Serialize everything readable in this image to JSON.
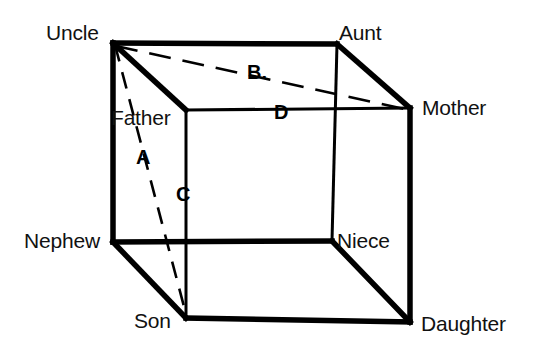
{
  "figure": {
    "type": "necker-cube-kinship-diagram",
    "background_color": "#ffffff",
    "line_color": "#000000"
  },
  "vertices": [
    {
      "id": "uncle",
      "label": "Uncle",
      "x": 113,
      "y": 43,
      "position": "back-top-left"
    },
    {
      "id": "aunt",
      "label": "Aunt",
      "x": 337,
      "y": 44,
      "position": "back-top-right"
    },
    {
      "id": "mother",
      "label": "Mother",
      "x": 410,
      "y": 108,
      "position": "front-top-right"
    },
    {
      "id": "father",
      "label": "Father",
      "x": 186,
      "y": 110,
      "position": "front-top-left"
    },
    {
      "id": "nephew",
      "label": "Nephew",
      "x": 113,
      "y": 242,
      "position": "back-bottom-left"
    },
    {
      "id": "niece",
      "label": "Niece",
      "x": 332,
      "y": 241,
      "position": "back-bottom-right"
    },
    {
      "id": "son",
      "label": "Son",
      "x": 186,
      "y": 318,
      "position": "front-bottom-left"
    },
    {
      "id": "daughter",
      "label": "Daughter",
      "x": 410,
      "y": 322,
      "position": "front-bottom-right"
    }
  ],
  "edge_labels": [
    {
      "id": "a",
      "label": "A",
      "from": "uncle",
      "to": "son",
      "style": "dashed"
    },
    {
      "id": "b",
      "label": "B.",
      "from": "uncle",
      "to": "mother",
      "style": "dashed"
    },
    {
      "id": "c",
      "label": "C",
      "from": "father",
      "to": "son",
      "style": "solid"
    },
    {
      "id": "d",
      "label": "D",
      "from": "father",
      "to": "mother",
      "style": "solid"
    }
  ],
  "edges": [
    {
      "from": "uncle",
      "to": "aunt",
      "style": "solid",
      "weight": "thick"
    },
    {
      "from": "uncle",
      "to": "nephew",
      "style": "solid",
      "weight": "thick"
    },
    {
      "from": "uncle",
      "to": "father",
      "style": "solid",
      "weight": "thick"
    },
    {
      "from": "aunt",
      "to": "mother",
      "style": "solid",
      "weight": "thick"
    },
    {
      "from": "aunt",
      "to": "niece",
      "style": "solid",
      "weight": "thin"
    },
    {
      "from": "nephew",
      "to": "son",
      "style": "solid",
      "weight": "thick"
    },
    {
      "from": "nephew",
      "to": "niece",
      "style": "solid",
      "weight": "thick"
    },
    {
      "from": "niece",
      "to": "daughter",
      "style": "solid",
      "weight": "thick"
    },
    {
      "from": "father",
      "to": "mother",
      "style": "solid",
      "weight": "thin"
    },
    {
      "from": "father",
      "to": "son",
      "style": "solid",
      "weight": "thin"
    },
    {
      "from": "son",
      "to": "daughter",
      "style": "solid",
      "weight": "thick"
    },
    {
      "from": "mother",
      "to": "daughter",
      "style": "solid",
      "weight": "thick"
    },
    {
      "from": "uncle",
      "to": "son",
      "style": "dashed",
      "weight": "thin"
    },
    {
      "from": "uncle",
      "to": "mother",
      "style": "dashed",
      "weight": "thin"
    }
  ]
}
